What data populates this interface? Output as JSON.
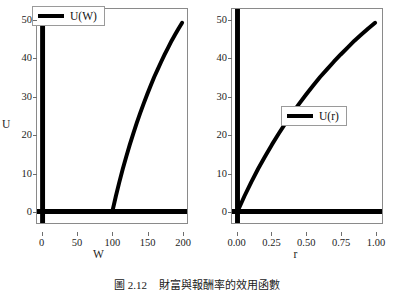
{
  "figure": {
    "caption_number": "圖 2.12",
    "caption_text": "財富與報酬率的效用函數"
  },
  "panels": [
    {
      "id": "left",
      "xlabel": "W",
      "ylabel": "U",
      "legend_label": "U(W)",
      "xticks": [
        "0",
        "50",
        "100",
        "150",
        "200"
      ],
      "xtick_values": [
        0,
        50,
        100,
        150,
        200
      ],
      "yticks": [
        "0",
        "10",
        "20",
        "30",
        "40",
        "50"
      ],
      "ytick_values": [
        0,
        10,
        20,
        30,
        40,
        50
      ]
    },
    {
      "id": "right",
      "xlabel": "r",
      "ylabel": "U",
      "legend_label": "U(r)",
      "xticks": [
        "0.00",
        "0.25",
        "0.50",
        "0.75",
        "1.00"
      ],
      "xtick_values": [
        0,
        0.25,
        0.5,
        0.75,
        1.0
      ],
      "yticks": [
        "0",
        "10",
        "20",
        "30",
        "40",
        "50"
      ],
      "ytick_values": [
        0,
        10,
        20,
        30,
        40,
        50
      ]
    }
  ],
  "chart_data": [
    {
      "type": "line",
      "title": "",
      "xlabel": "W",
      "ylabel": "U",
      "xlim": [
        -8,
        207
      ],
      "ylim": [
        -3,
        53
      ],
      "grid": false,
      "legend_position": "top-left",
      "series": [
        {
          "name": "U(W)",
          "color": "#000000",
          "x": [
            100,
            105,
            110,
            115,
            120,
            125,
            130,
            135,
            140,
            145,
            150,
            155,
            160,
            165,
            170,
            175,
            180,
            185,
            190,
            195,
            200
          ],
          "values": [
            0,
            4.0,
            7.7,
            11.2,
            14.4,
            17.5,
            20.4,
            23.2,
            25.8,
            28.3,
            30.7,
            33.0,
            35.2,
            37.2,
            39.2,
            41.1,
            42.9,
            44.7,
            46.3,
            47.9,
            49.4
          ]
        },
        {
          "name": "x-axis-zero-line",
          "color": "#000000",
          "x": [
            -8,
            207
          ],
          "values": [
            0,
            0
          ]
        },
        {
          "name": "y-axis-zero-line",
          "color": "#000000",
          "x": [
            0,
            0
          ],
          "values": [
            -3,
            53
          ]
        }
      ]
    },
    {
      "type": "line",
      "title": "",
      "xlabel": "r",
      "ylabel": "U",
      "xlim": [
        -0.04,
        1.05
      ],
      "ylim": [
        -3,
        53
      ],
      "grid": false,
      "legend_position": "center-right",
      "series": [
        {
          "name": "U(r)",
          "color": "#000000",
          "x": [
            0.0,
            0.05,
            0.1,
            0.15,
            0.2,
            0.25,
            0.3,
            0.35,
            0.4,
            0.45,
            0.5,
            0.55,
            0.6,
            0.65,
            0.7,
            0.75,
            0.8,
            0.85,
            0.9,
            0.95,
            1.0
          ],
          "values": [
            0,
            4.0,
            7.7,
            11.2,
            14.4,
            17.5,
            20.4,
            23.2,
            25.8,
            28.3,
            30.7,
            33.0,
            35.2,
            37.2,
            39.2,
            41.1,
            42.9,
            44.7,
            46.3,
            47.9,
            49.4
          ]
        },
        {
          "name": "x-axis-zero-line",
          "color": "#000000",
          "x": [
            -0.04,
            1.05
          ],
          "values": [
            0,
            0
          ]
        },
        {
          "name": "y-axis-zero-line",
          "color": "#000000",
          "x": [
            0,
            0
          ],
          "values": [
            -3,
            53
          ]
        }
      ]
    }
  ]
}
